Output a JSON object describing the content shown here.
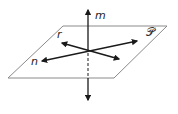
{
  "diagram": {
    "plane": {
      "label": "𝒫",
      "stroke": "#8a8a8a"
    },
    "lines": [
      {
        "id": "m",
        "label": "m",
        "role": "perpendicular to plane"
      },
      {
        "id": "r",
        "label": "r",
        "role": "in plane"
      },
      {
        "id": "n",
        "label": "n",
        "role": "in plane"
      }
    ],
    "colors": {
      "line": "#1a1a1a",
      "plane": "#8a8a8a",
      "background": "#ffffff"
    }
  }
}
